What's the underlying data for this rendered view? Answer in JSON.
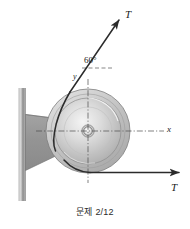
{
  "figure": {
    "caption": "문제 2/12",
    "labels": {
      "tension_top": "T",
      "tension_bottom": "T",
      "axis_y": "y",
      "axis_x": "x",
      "angle": "60°"
    },
    "colors": {
      "line": "#2b2b2b",
      "wall": "#9a9a9a",
      "bracket": "#8f8f8f",
      "wheel_rim": "#b9b9b9",
      "wheel_face": "#d6d6d6",
      "hub": "#e8e8e8",
      "caption_text": "#2b2b2b"
    },
    "geometry": {
      "center_x": 88,
      "center_y": 131,
      "wheel_outer_radius": 42,
      "wheel_inner_radius": 33,
      "hub_radius": 5,
      "rope_angle_deg": 60
    }
  }
}
